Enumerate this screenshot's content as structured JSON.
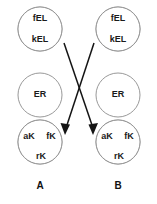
{
  "figure": {
    "type": "compartment-diagram",
    "background_color": "#ffffff",
    "outline_color": "#8d8d8d",
    "shaded_color": "#8a8a8a",
    "unshaded_color": "#ffffff",
    "arrow_color": "#141414",
    "columns": [
      {
        "id": "column-a",
        "label": "A",
        "circles": [
          {
            "id": "a-top",
            "shape": "circle-half-split",
            "segments": [
              {
                "label": "fEL",
                "fill": "unshaded",
                "position": "top-half"
              },
              {
                "label": "kEL",
                "fill": "shaded",
                "position": "bottom-half"
              }
            ]
          },
          {
            "id": "a-middle",
            "shape": "circle-plain",
            "segments": [
              {
                "label": "ER",
                "fill": "unshaded",
                "position": "whole"
              }
            ]
          },
          {
            "id": "a-bottom",
            "shape": "circle-thirds",
            "segments": [
              {
                "label": "aK",
                "fill": "shaded",
                "position": "upper-left-third"
              },
              {
                "label": "fK",
                "fill": "unshaded",
                "position": "upper-right-third"
              },
              {
                "label": "rK",
                "fill": "unshaded",
                "position": "lower-third"
              }
            ]
          }
        ]
      },
      {
        "id": "column-b",
        "label": "B",
        "circles": [
          {
            "id": "b-top",
            "shape": "circle-half-split",
            "segments": [
              {
                "label": "fEL",
                "fill": "unshaded",
                "position": "top-half"
              },
              {
                "label": "kEL",
                "fill": "shaded",
                "position": "bottom-half"
              }
            ]
          },
          {
            "id": "b-middle",
            "shape": "circle-plain",
            "segments": [
              {
                "label": "ER",
                "fill": "unshaded",
                "position": "whole"
              }
            ]
          },
          {
            "id": "b-bottom",
            "shape": "circle-thirds",
            "segments": [
              {
                "label": "aK",
                "fill": "shaded",
                "position": "upper-left-third"
              },
              {
                "label": "fK",
                "fill": "unshaded",
                "position": "upper-right-third"
              },
              {
                "label": "rK",
                "fill": "unshaded",
                "position": "lower-third"
              }
            ]
          }
        ]
      }
    ],
    "arrows": [
      {
        "id": "arrow-a-top-to-b-bottom",
        "from": "a-top",
        "to": "b-bottom",
        "direction": "down-right",
        "style": "solid-arrowhead"
      },
      {
        "id": "arrow-b-top-to-a-bottom",
        "from": "b-top",
        "to": "a-bottom",
        "direction": "down-left",
        "style": "solid-arrowhead"
      }
    ]
  }
}
